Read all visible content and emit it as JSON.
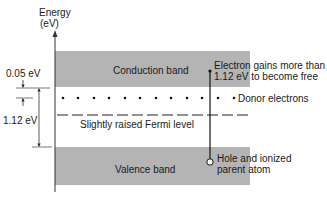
{
  "axis": {
    "label_line1": "Energy",
    "label_line2": "(eV)"
  },
  "bands": {
    "conduction": {
      "label": "Conduction band",
      "color": "#b4b4b4"
    },
    "valence": {
      "label": "Valence band",
      "color": "#b4b4b4"
    }
  },
  "levels": {
    "donor_label": "Donor electrons",
    "fermi_label": "Slightly raised Fermi level"
  },
  "dimensions": {
    "donor_gap": "0.05 eV",
    "band_gap": "1.12 eV"
  },
  "annotations": {
    "electron_line1": "Electron gains more than",
    "electron_line2": "1.12 eV to become free",
    "hole_line1": "Hole and ionized",
    "hole_line2": "parent atom"
  }
}
